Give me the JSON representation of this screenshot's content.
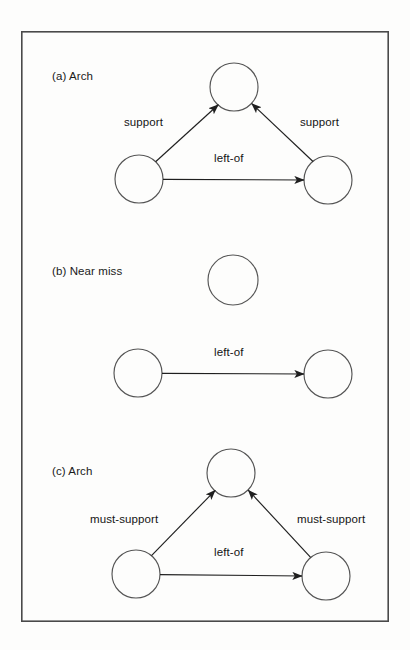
{
  "figure": {
    "background_color": "#fdfdfc",
    "ink_color": "#2b2b2b",
    "border": {
      "name": "figure-border",
      "x": 21,
      "y": 31,
      "width": 368,
      "height": 591,
      "stroke": "#4a4a4a",
      "stroke_width": 1.6
    },
    "panels": [
      {
        "id": "a",
        "label": "(a) Arch",
        "label_x": 52,
        "label_y": 77,
        "nodes": [
          {
            "name": "node-top",
            "cx": 234,
            "cy": 87,
            "r": 24
          },
          {
            "name": "node-left",
            "cx": 139,
            "cy": 179,
            "r": 24
          },
          {
            "name": "node-right",
            "cx": 328,
            "cy": 180,
            "r": 24
          }
        ],
        "edges": [
          {
            "name": "edge-support-left",
            "label": "support",
            "from": "node-left",
            "to": "node-top",
            "label_x": 124,
            "label_y": 123
          },
          {
            "name": "edge-support-right",
            "label": "support",
            "from": "node-right",
            "to": "node-top",
            "label_x": 300,
            "label_y": 123
          },
          {
            "name": "edge-left-of",
            "label": "left-of",
            "from": "node-left",
            "to": "node-right",
            "label_x": 214,
            "label_y": 159
          }
        ]
      },
      {
        "id": "b",
        "label": "(b) Near miss",
        "label_x": 52,
        "label_y": 272,
        "nodes": [
          {
            "name": "node-top",
            "cx": 233,
            "cy": 280,
            "r": 25
          },
          {
            "name": "node-left",
            "cx": 138,
            "cy": 373,
            "r": 24
          },
          {
            "name": "node-right",
            "cx": 328,
            "cy": 374,
            "r": 24
          }
        ],
        "edges": [
          {
            "name": "edge-left-of",
            "label": "left-of",
            "from": "node-left",
            "to": "node-right",
            "label_x": 214,
            "label_y": 353
          }
        ]
      },
      {
        "id": "c",
        "label": "(c) Arch",
        "label_x": 52,
        "label_y": 472,
        "nodes": [
          {
            "name": "node-top",
            "cx": 231,
            "cy": 473,
            "r": 24
          },
          {
            "name": "node-left",
            "cx": 136,
            "cy": 574,
            "r": 24
          },
          {
            "name": "node-right",
            "cx": 326,
            "cy": 576,
            "r": 24
          }
        ],
        "edges": [
          {
            "name": "edge-must-support-left",
            "label": "must-support",
            "from": "node-left",
            "to": "node-top",
            "label_x": 90,
            "label_y": 520
          },
          {
            "name": "edge-must-support-right",
            "label": "must-support",
            "from": "node-right",
            "to": "node-top",
            "label_x": 297,
            "label_y": 520
          },
          {
            "name": "edge-left-of",
            "label": "left-of",
            "from": "node-left",
            "to": "node-right",
            "label_x": 214,
            "label_y": 553
          }
        ]
      }
    ]
  }
}
